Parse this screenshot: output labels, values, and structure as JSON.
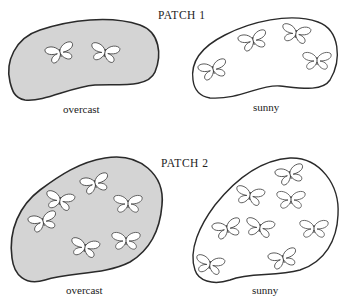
{
  "patch1": {
    "title": "PATCH 1",
    "overcast": {
      "label": "overcast",
      "butterfly_count": 2,
      "butterflies": [
        [
          60,
          52
        ],
        [
          105,
          52
        ]
      ]
    },
    "sunny": {
      "label": "sunny",
      "butterfly_count": 4,
      "butterflies": [
        [
          253,
          40
        ],
        [
          296,
          33
        ],
        [
          317,
          60
        ],
        [
          213,
          69
        ]
      ]
    }
  },
  "patch2": {
    "title": "PATCH 2",
    "overcast": {
      "label": "overcast",
      "butterfly_count": 6,
      "butterflies": [
        [
          95,
          183
        ],
        [
          60,
          200
        ],
        [
          128,
          203
        ],
        [
          43,
          221
        ],
        [
          85,
          247
        ],
        [
          126,
          240
        ]
      ]
    },
    "sunny": {
      "label": "sunny",
      "butterfly_count": 8,
      "butterflies": [
        [
          290,
          174
        ],
        [
          250,
          195
        ],
        [
          291,
          199
        ],
        [
          227,
          228
        ],
        [
          260,
          227
        ],
        [
          314,
          228
        ],
        [
          283,
          258
        ],
        [
          210,
          264
        ]
      ]
    }
  },
  "colors": {
    "overcast_fill": "#d4d4d4",
    "sunny_fill": "#ffffff",
    "outline": "#2a2a2a"
  },
  "icons": {
    "butterfly": "butterfly-icon"
  }
}
